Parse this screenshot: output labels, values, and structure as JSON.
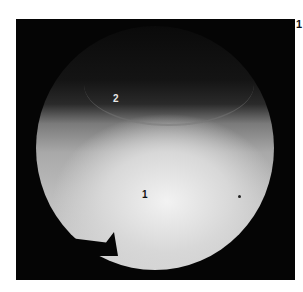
{
  "image": {
    "description": "Circular endoscopic grayscale view on black square background",
    "labels": [
      {
        "id": "label-2",
        "text": "2"
      },
      {
        "id": "label-1",
        "text": "1"
      }
    ],
    "corner_mark": "1",
    "colors": {
      "background": "#050505",
      "bright_region": "#e6e6e6",
      "dark_region": "#0a0a0a"
    }
  }
}
